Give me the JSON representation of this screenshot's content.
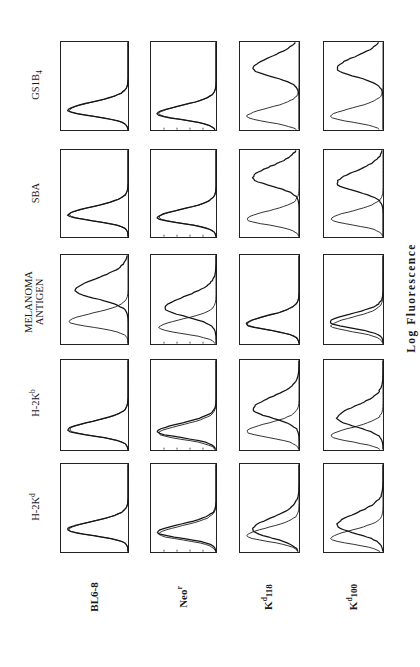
{
  "figure": {
    "orientation": "rotated 90deg counter-clockwise",
    "x_axis_label": "Log Fluorescence",
    "stains": [
      "GS1B4",
      "SBA",
      "MELANOMA ANTIGEN",
      "H-2Kb",
      "H-2Kd"
    ],
    "cell_lines": [
      "BL6-8",
      "Neor",
      "Kd118",
      "Kd100"
    ]
  },
  "labels": {
    "rows": [
      {
        "main": "GS1B",
        "sub": "4",
        "sup": ""
      },
      {
        "main": "SBA",
        "sub": "",
        "sup": ""
      },
      {
        "main": "MELANOMA",
        "line2": "ANTIGEN"
      },
      {
        "main": "H-2K",
        "sup": "b"
      },
      {
        "main": "H-2K",
        "sup": "d"
      }
    ],
    "cols": [
      {
        "main": "BL6-8",
        "sup": "",
        "sub": ""
      },
      {
        "main": "Neo",
        "sup": "r",
        "sub": ""
      },
      {
        "pre": "K",
        "sup": "d",
        "sub": "118"
      },
      {
        "pre": "K",
        "sup": "d",
        "sub": "100"
      }
    ],
    "axis": "Log Fluorescence"
  },
  "chart_data": {
    "type": "histogram-grid",
    "title": "",
    "xlabel": "Log Fluorescence",
    "ylabel": "Cell count",
    "rows": [
      "GS1B4",
      "SBA",
      "MELANOMA ANTIGEN",
      "H-2Kb",
      "H-2Kd"
    ],
    "cols": [
      "BL6-8",
      "Neor",
      "Kd118",
      "Kd100"
    ],
    "note": "Each panel overlays a control (thin) and stained (thick) histogram; peak positions given as fraction of log-fluorescence axis (0=low, 1=high).",
    "panels": [
      {
        "stain": "GS1B4",
        "cell": "BL6-8",
        "control_peak": 0.22,
        "stained_peak": 0.22,
        "positive": false
      },
      {
        "stain": "GS1B4",
        "cell": "Neor",
        "control_peak": 0.18,
        "stained_peak": 0.18,
        "positive": false
      },
      {
        "stain": "GS1B4",
        "cell": "Kd118",
        "control_peak": 0.15,
        "stained_peak": 0.7,
        "positive": true
      },
      {
        "stain": "GS1B4",
        "cell": "Kd100",
        "control_peak": 0.15,
        "stained_peak": 0.7,
        "positive": true
      },
      {
        "stain": "SBA",
        "cell": "BL6-8",
        "control_peak": 0.25,
        "stained_peak": 0.25,
        "positive": false
      },
      {
        "stain": "SBA",
        "cell": "Neor",
        "control_peak": 0.22,
        "stained_peak": 0.22,
        "positive": false
      },
      {
        "stain": "SBA",
        "cell": "Kd118",
        "control_peak": 0.2,
        "stained_peak": 0.68,
        "positive": true
      },
      {
        "stain": "SBA",
        "cell": "Kd100",
        "control_peak": 0.2,
        "stained_peak": 0.62,
        "positive": true
      },
      {
        "stain": "MELANOMA ANTIGEN",
        "cell": "BL6-8",
        "control_peak": 0.25,
        "stained_peak": 0.6,
        "positive": true
      },
      {
        "stain": "MELANOMA ANTIGEN",
        "cell": "Neor",
        "control_peak": 0.18,
        "stained_peak": 0.4,
        "positive": true
      },
      {
        "stain": "MELANOMA ANTIGEN",
        "cell": "Kd118",
        "control_peak": 0.22,
        "stained_peak": 0.22,
        "positive": false
      },
      {
        "stain": "MELANOMA ANTIGEN",
        "cell": "Kd100",
        "control_peak": 0.2,
        "stained_peak": 0.24,
        "positive": false
      },
      {
        "stain": "H-2Kb",
        "cell": "BL6-8",
        "control_peak": 0.22,
        "stained_peak": 0.22,
        "positive": false
      },
      {
        "stain": "H-2Kb",
        "cell": "Neor",
        "control_peak": 0.18,
        "stained_peak": 0.2,
        "positive": false
      },
      {
        "stain": "H-2Kb",
        "cell": "Kd118",
        "control_peak": 0.2,
        "stained_peak": 0.45,
        "positive": true
      },
      {
        "stain": "H-2Kb",
        "cell": "Kd100",
        "control_peak": 0.15,
        "stained_peak": 0.35,
        "positive": true
      },
      {
        "stain": "H-2Kd",
        "cell": "BL6-8",
        "control_peak": 0.25,
        "stained_peak": 0.25,
        "positive": false
      },
      {
        "stain": "H-2Kd",
        "cell": "Neor",
        "control_peak": 0.2,
        "stained_peak": 0.22,
        "positive": false
      },
      {
        "stain": "H-2Kd",
        "cell": "Kd118",
        "control_peak": 0.18,
        "stained_peak": 0.25,
        "positive": true
      },
      {
        "stain": "H-2Kd",
        "cell": "Kd100",
        "control_peak": 0.15,
        "stained_peak": 0.3,
        "positive": true
      }
    ]
  }
}
